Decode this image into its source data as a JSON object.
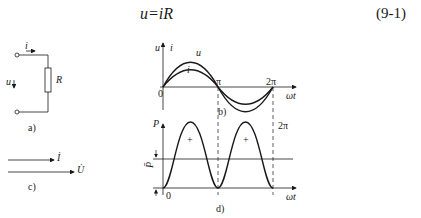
{
  "equation": {
    "formula": "u=iR",
    "number": "(9-1)"
  },
  "figure_a": {
    "caption": "a)",
    "current_label": "i",
    "voltage_label": "u",
    "resistor_label": "R"
  },
  "figure_b": {
    "caption": "b)",
    "y_label_u": "u",
    "y_label_i": "i",
    "curve_u_label": "u",
    "curve_i_label": "i",
    "origin_label": "0",
    "pi_label": "π",
    "two_pi_label": "2π",
    "x_label": "ωt"
  },
  "figure_c": {
    "caption": "c)",
    "current_phasor": "İ",
    "voltage_phasor": "U̇"
  },
  "figure_d": {
    "caption": "d)",
    "y_label": "P",
    "avg_label": "P̄",
    "origin_label": "0",
    "two_pi_label": "2π",
    "x_label": "ωt",
    "plus_1": "+",
    "plus_2": "+"
  },
  "colors": {
    "line": "#1a1a1a",
    "background": "#ffffff"
  }
}
